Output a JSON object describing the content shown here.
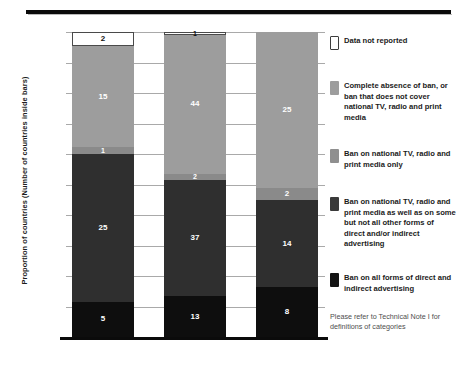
{
  "chart_data": {
    "type": "bar",
    "subtype": "stacked-bar-100-percent",
    "title": "",
    "xlabel": "",
    "ylabel": "Proportion of countries (Number of countries inside bars)",
    "ylim": [
      0,
      100
    ],
    "ytick_labels": [
      "100%",
      "90%",
      "80%",
      "70%",
      "60%",
      "50%",
      "40%",
      "30%",
      "20%",
      "10%",
      "0%"
    ],
    "grid": true,
    "legend_position": "right",
    "categories": [
      "High-income",
      "Middle-income",
      "Low-income"
    ],
    "series": [
      {
        "name": "Ban on all forms of direct and indirect advertising",
        "color": "#0e0e0e",
        "values": [
          5,
          13,
          8
        ],
        "percents": [
          11.6,
          13.4,
          16.3
        ]
      },
      {
        "name": "Ban on national TV, radio and print media as well as on some but not all other forms of direct and/or indirect advertising",
        "color": "#2f2f2f",
        "values": [
          25,
          37,
          14
        ],
        "percents": [
          48.4,
          38.1,
          28.6
        ]
      },
      {
        "name": "Ban on national TV, radio and print media only",
        "color": "#8a8a8a",
        "values": [
          1,
          2,
          2
        ],
        "percents": [
          2.3,
          2.1,
          4.1
        ]
      },
      {
        "name": "Complete absence of ban, or ban that does not cover national TV, radio and print media",
        "color": "#9d9d9d",
        "values": [
          15,
          44,
          25
        ],
        "percents": [
          33.0,
          45.4,
          51.0
        ]
      },
      {
        "name": "Data not reported",
        "color": "#ffffff",
        "values": [
          2,
          1,
          0
        ],
        "percents": [
          4.7,
          1.0,
          0.0
        ]
      }
    ],
    "totals": [
      43,
      97,
      49
    ]
  },
  "axis": {
    "y_title": "Proportion of countries (Number of countries inside bars)",
    "ticks": [
      {
        "label": "100%",
        "value": 100
      },
      {
        "label": "90%",
        "value": 90
      },
      {
        "label": "80%",
        "value": 80
      },
      {
        "label": "70%",
        "value": 70
      },
      {
        "label": "60%",
        "value": 60
      },
      {
        "label": "50%",
        "value": 50
      },
      {
        "label": "40%",
        "value": 40
      },
      {
        "label": "30%",
        "value": 30
      },
      {
        "label": "20%",
        "value": 20
      },
      {
        "label": "10%",
        "value": 10
      },
      {
        "label": "0%",
        "value": 0
      }
    ],
    "x_categories": [
      "High-income",
      "Middle-income",
      "Low-income"
    ]
  },
  "bars": [
    {
      "category": "High-income",
      "segments": [
        {
          "label": "2",
          "swatch": "white",
          "pct": 4.7
        },
        {
          "label": "15",
          "swatch": "light",
          "pct": 33.0
        },
        {
          "label": "1",
          "swatch": "mid",
          "pct": 2.3
        },
        {
          "label": "25",
          "swatch": "dark",
          "pct": 48.4
        },
        {
          "label": "5",
          "swatch": "black",
          "pct": 11.6
        }
      ]
    },
    {
      "category": "Middle-income",
      "segments": [
        {
          "label": "1",
          "swatch": "white",
          "pct": 1.0
        },
        {
          "label": "44",
          "swatch": "light",
          "pct": 45.4
        },
        {
          "label": "2",
          "swatch": "mid",
          "pct": 2.1
        },
        {
          "label": "37",
          "swatch": "dark",
          "pct": 38.1
        },
        {
          "label": "13",
          "swatch": "black",
          "pct": 13.4
        }
      ]
    },
    {
      "category": "Low-income",
      "segments": [
        {
          "label": "",
          "swatch": "white",
          "pct": 0.0
        },
        {
          "label": "25",
          "swatch": "light",
          "pct": 51.0
        },
        {
          "label": "2",
          "swatch": "mid",
          "pct": 4.1
        },
        {
          "label": "14",
          "swatch": "dark",
          "pct": 28.6
        },
        {
          "label": "8",
          "swatch": "black",
          "pct": 16.3
        }
      ]
    }
  ],
  "legend": {
    "items": [
      {
        "swatch": "white",
        "text": "Data not reported",
        "top": 0
      },
      {
        "swatch": "light",
        "text": "Complete absence of ban, or ban that does not cover national TV, radio and print media",
        "top": 45
      },
      {
        "swatch": "mid",
        "text": "Ban on national TV, radio and print media only",
        "top": 113
      },
      {
        "swatch": "dark",
        "text": "Ban on national TV, radio and print media as well as on some but not all other forms of direct and/or indirect advertising",
        "top": 161
      },
      {
        "swatch": "black",
        "text": "Ban on all forms of direct and indirect advertising",
        "top": 237
      }
    ],
    "note": "Please refer to Technical Note I for definitions of categories"
  }
}
